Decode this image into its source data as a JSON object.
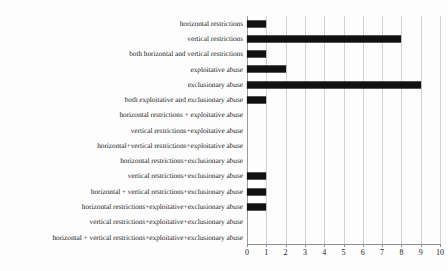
{
  "chart_data": {
    "type": "bar",
    "orientation": "horizontal",
    "title": "",
    "subtitle": "",
    "xlabel": "",
    "ylabel": "",
    "xlim": [
      0,
      10
    ],
    "ylim": null,
    "grid": true,
    "gridlines_axis": "x",
    "legend": null,
    "legend_position": "none",
    "bar_color": "#111111",
    "background_color": "#fdfdfd",
    "gridline_color": "#d2d2d2",
    "axis_color": "#8f8f8f",
    "xticks": [
      0,
      1,
      2,
      3,
      4,
      5,
      6,
      7,
      8,
      9,
      10
    ],
    "xtick_labels": [
      "0",
      "1",
      "2",
      "3",
      "4",
      "5",
      "6",
      "7",
      "8",
      "9",
      "10"
    ],
    "categories": [
      "horizontal restrictions",
      "vertical restrictions",
      "both horizontal and vertical restrictions",
      "exploitative abuse",
      "exclusionary abuse",
      "both exploitative and exclusionary abuse",
      "horizontal restrictions + exploitative abuse",
      "vertical restrictions+exploitative abuse",
      "horizontal+vertical restrictions+exploitative abuse",
      "horizontal restrictions+exclusionary abuse",
      "vertical restrictions+exclusionary abuse",
      "horizontal + vertical restrictions+exclusionary abuse",
      "horizontal restrictions+exploitative+exclusionary abuse",
      "vertical restrictions+exploitative+exclusionary abuse",
      "horizontal + vertical restrictions+exploitative+exclusionary abuse"
    ],
    "values": [
      1,
      8,
      1,
      2,
      9,
      1,
      0,
      0,
      0,
      0,
      1,
      1,
      1,
      0,
      0
    ],
    "annotations": []
  }
}
